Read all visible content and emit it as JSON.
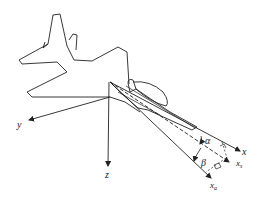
{
  "diagram": {
    "axes": {
      "x": {
        "label": "x",
        "sub": ""
      },
      "y": {
        "label": "y",
        "sub": ""
      },
      "z": {
        "label": "z",
        "sub": ""
      },
      "xs": {
        "label": "x",
        "sub": "s"
      },
      "xa": {
        "label": "x",
        "sub": "a"
      }
    },
    "angles": {
      "alpha": "α",
      "beta": "β"
    },
    "colors": {
      "line": "#222222",
      "background": "#ffffff"
    }
  }
}
